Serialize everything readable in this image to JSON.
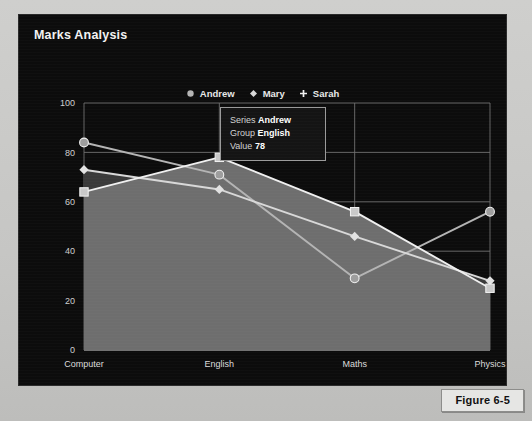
{
  "figure": {
    "caption": "Figure 6-5"
  },
  "panel": {
    "title": "Marks Analysis",
    "background_color": "#0c0c0c",
    "text_color": "#f2f2f2"
  },
  "legend": {
    "position": "top-center",
    "items": [
      {
        "label": "Andrew",
        "marker": "circle-marker-icon",
        "color": "#b4b4b4"
      },
      {
        "label": "Mary",
        "marker": "diamond-marker-icon",
        "color": "#d8d8d8"
      },
      {
        "label": "Sarah",
        "marker": "plus-marker-icon",
        "color": "#f0f0f0"
      }
    ]
  },
  "tooltip": {
    "series_key": "Series",
    "series_value": "Andrew",
    "group_key": "Group",
    "group_value": "English",
    "value_key": "Value",
    "value_value": "78",
    "border_color": "#9a9a9a",
    "background_color": "#141414"
  },
  "chart_data": {
    "type": "line",
    "title": "Marks Analysis",
    "xlabel": "",
    "ylabel": "",
    "categories": [
      "Computer",
      "English",
      "Maths",
      "Physics"
    ],
    "ylim": [
      0,
      100
    ],
    "yticks": [
      0,
      20,
      40,
      60,
      80,
      100
    ],
    "ytick_labels": [
      "0",
      "20",
      "40",
      "60",
      "80",
      "100"
    ],
    "grid": true,
    "legend_position": "top-center",
    "series": [
      {
        "name": "Andrew",
        "values": [
          84,
          71,
          29,
          56
        ],
        "marker": "circle",
        "color": "#b4b4b4",
        "filled_area": false
      },
      {
        "name": "Mary",
        "values": [
          73,
          65,
          46,
          28
        ],
        "marker": "diamond",
        "color": "#d8d8d8",
        "filled_area": true
      },
      {
        "name": "Sarah",
        "values": [
          64,
          78,
          56,
          25
        ],
        "marker": "square",
        "color": "#f0f0f0",
        "filled_area": true
      }
    ],
    "annotations": [
      {
        "text": "Series Andrew / Group English / Value 78",
        "type": "tooltip",
        "at_category": "English",
        "at_value": 78
      }
    ]
  }
}
